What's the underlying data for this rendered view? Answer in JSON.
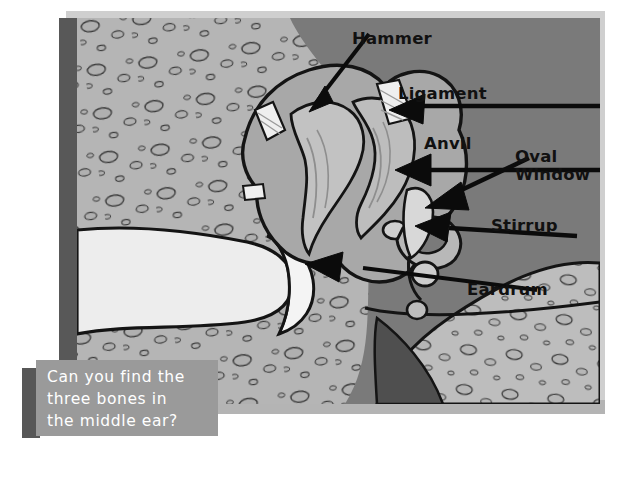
{
  "figure": {
    "title_alt": "Cross-section diagram of the middle ear",
    "background": {
      "bone_fill": "#b5b5b5",
      "dark_field": "#7a7a7a",
      "canal_fill": "#ededed",
      "bone_body": "#a8a8a8",
      "tube_dark": "#4f4f4f",
      "frame_light": "#cfcfcf",
      "frame_dark": "#585858",
      "outline": "#141414"
    },
    "labels": [
      {
        "id": "hammer",
        "text": "Hammer",
        "x": 352,
        "y": 30,
        "pointer": "arrow"
      },
      {
        "id": "ligament",
        "text": "Ligament",
        "x": 398,
        "y": 85,
        "pointer": "arrow"
      },
      {
        "id": "anvil",
        "text": "Anvil",
        "x": 424,
        "y": 135,
        "pointer": "arrow"
      },
      {
        "id": "oval-window",
        "text": "Oval\nWindow",
        "x": 515,
        "y": 148,
        "pointer": "arrow"
      },
      {
        "id": "stirrup",
        "text": "Stirrup",
        "x": 491,
        "y": 217,
        "pointer": "arrow"
      },
      {
        "id": "eardrum",
        "text": "Eardrum",
        "x": 467,
        "y": 281,
        "pointer": "arrow"
      }
    ]
  },
  "caption": {
    "text": "Can you find the\nthree bones in\nthe middle ear?",
    "background": "#9a9a9a",
    "shadow": "#575757",
    "text_color": "#ffffff"
  }
}
